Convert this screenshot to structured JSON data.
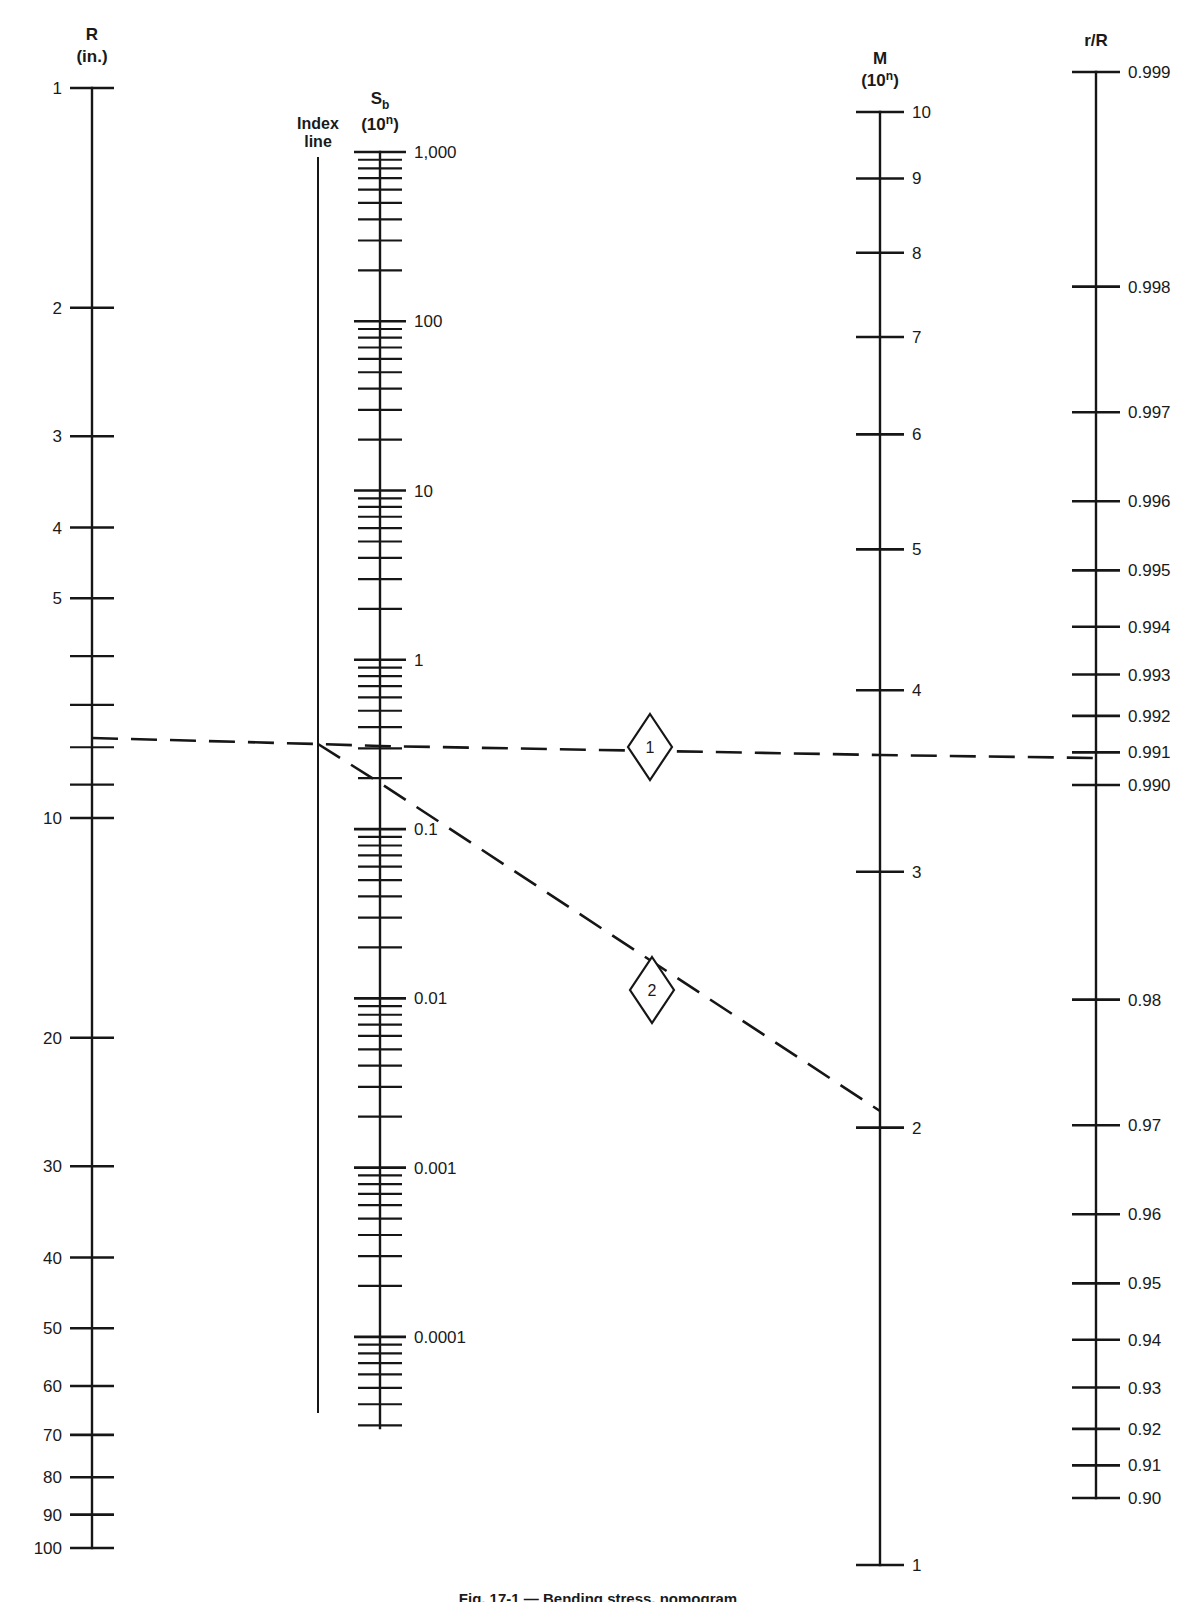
{
  "figure": {
    "caption": "Fig. 17-1 — Bending stress, nomogram",
    "background_color": "#ffffff",
    "line_color": "#161616"
  },
  "axes": {
    "R": {
      "title_main": "R",
      "title_unit": "(in.)",
      "name": "R",
      "scale": "log",
      "min": 1,
      "max": 100,
      "x": 92,
      "y_top": 88,
      "y_bottom": 1548,
      "labeled_ticks": [
        "1",
        "2",
        "3",
        "4",
        "5",
        "10",
        "20",
        "30",
        "40",
        "50",
        "60",
        "70",
        "80",
        "90",
        "100"
      ],
      "labeled_values": [
        1,
        2,
        3,
        4,
        5,
        10,
        20,
        30,
        40,
        50,
        60,
        70,
        80,
        90,
        100
      ],
      "minor_values": [
        6,
        7,
        8,
        9
      ]
    },
    "index": {
      "title_line1": "Index",
      "title_line2": "line",
      "name": "Index line",
      "x": 318,
      "y_top": 157,
      "y_bottom": 1413
    },
    "Sb": {
      "title_main": "S",
      "title_sub": "b",
      "title_unit_base": "(10",
      "title_unit_exp": "n",
      "title_unit_close": ")",
      "name": "Sb (10^n)",
      "scale": "log",
      "x": 380,
      "y_top": 152,
      "y_bottom": 1428,
      "max": 1000,
      "min": 2e-05,
      "labeled_ticks": [
        "1,000",
        "100",
        "10",
        "1",
        "0.1",
        "0.01",
        "0.001",
        "0.0001"
      ],
      "labeled_values": [
        1000,
        100,
        10,
        1,
        0.1,
        0.01,
        0.001,
        0.0001
      ]
    },
    "M": {
      "title_main": "M",
      "title_unit_base": "(10",
      "title_unit_exp": "n",
      "title_unit_close": ")",
      "name": "M (10^n)",
      "scale": "log",
      "x": 880,
      "y_top": 112,
      "y_bottom": 1565,
      "max": 10,
      "min": 1,
      "labeled_ticks": [
        "10",
        "9",
        "8",
        "7",
        "6",
        "5",
        "4",
        "3",
        "2",
        "1"
      ],
      "labeled_values": [
        10,
        9,
        8,
        7,
        6,
        5,
        4,
        3,
        2,
        1
      ]
    },
    "rR": {
      "title_main": "r/R",
      "name": "r/R",
      "scale": "log-reciprocal",
      "x": 1096,
      "y_top": 72,
      "y_bottom": 1498,
      "labeled_ticks": [
        "0.999",
        "0.998",
        "0.997",
        "0.996",
        "0.995",
        "0.994",
        "0.993",
        "0.992",
        "0.991",
        "0.990",
        "0.98",
        "0.97",
        "0.96",
        "0.95",
        "0.94",
        "0.93",
        "0.92",
        "0.91",
        "0.90"
      ],
      "labeled_values": [
        0.999,
        0.998,
        0.997,
        0.996,
        0.995,
        0.994,
        0.993,
        0.992,
        0.991,
        0.99,
        0.98,
        0.97,
        0.96,
        0.95,
        0.94,
        0.93,
        0.92,
        0.91,
        0.9
      ]
    }
  },
  "iso_lines": [
    {
      "marker_label": "1",
      "marker_x": 650,
      "marker_y": 747,
      "points": [
        [
          92,
          738
        ],
        [
          318,
          744
        ],
        [
          380,
          746
        ],
        [
          880,
          755
        ],
        [
          1096,
          758
        ]
      ],
      "description": "R to r/R through index line and M"
    },
    {
      "marker_label": "2",
      "marker_x": 652,
      "marker_y": 990,
      "points": [
        [
          318,
          744
        ],
        [
          380,
          783
        ],
        [
          880,
          1111
        ]
      ],
      "description": "index line through Sb to M"
    }
  ],
  "chart_data": {
    "type": "line",
    "subtitle": "Alignment-chart (nomograph) with five parallel logarithmic scales",
    "xlabel": "",
    "ylabel": "",
    "grid": false,
    "legend": "none",
    "scales": [
      {
        "name": "R",
        "unit": "in.",
        "type": "log",
        "range": [
          1,
          100
        ],
        "direction": "descending-downward",
        "tick_labels": [
          "1",
          "2",
          "3",
          "4",
          "5",
          "10",
          "20",
          "30",
          "40",
          "50",
          "60",
          "70",
          "80",
          "90",
          "100"
        ]
      },
      {
        "name": "Index line",
        "unit": "",
        "type": "reference",
        "range": [
          null,
          null
        ],
        "direction": "vertical-reference",
        "tick_labels": []
      },
      {
        "name": "Sb",
        "unit": "10^n",
        "type": "log",
        "range": [
          0.0001,
          1000
        ],
        "direction": "descending-downward",
        "tick_labels": [
          "1,000",
          "100",
          "10",
          "1",
          "0.1",
          "0.01",
          "0.001",
          "0.0001"
        ]
      },
      {
        "name": "M",
        "unit": "10^n",
        "type": "log",
        "range": [
          1,
          10
        ],
        "direction": "descending-downward",
        "tick_labels": [
          "10",
          "9",
          "8",
          "7",
          "6",
          "5",
          "4",
          "3",
          "2",
          "1"
        ]
      },
      {
        "name": "r/R",
        "unit": "",
        "type": "log-reciprocal",
        "range": [
          0.9,
          0.999
        ],
        "direction": "descending-downward",
        "tick_labels": [
          "0.999",
          "0.998",
          "0.997",
          "0.996",
          "0.995",
          "0.994",
          "0.993",
          "0.992",
          "0.991",
          "0.990",
          "0.98",
          "0.97",
          "0.96",
          "0.95",
          "0.94",
          "0.93",
          "0.92",
          "0.91",
          "0.90"
        ]
      }
    ],
    "annotations": [
      {
        "label": "1",
        "shape": "diamond",
        "reads": {
          "R": 7.5,
          "r_over_R": 0.991
        }
      },
      {
        "label": "2",
        "shape": "diamond",
        "reads": {
          "Sb": 0.1,
          "M": 2
        }
      }
    ]
  }
}
